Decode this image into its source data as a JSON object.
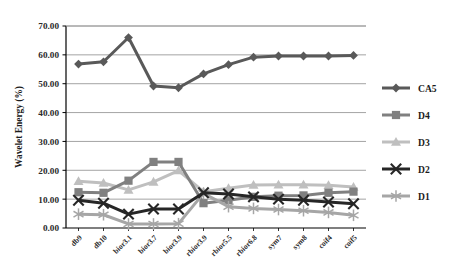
{
  "chart_data": {
    "type": "line",
    "title": "",
    "xlabel": "",
    "ylabel": "Wavelet Energy (%)",
    "ylim": [
      0,
      70
    ],
    "ytick_step": 10,
    "ytick_labels": [
      "0.00",
      "10.00",
      "20.00",
      "30.00",
      "40.00",
      "50.00",
      "60.00",
      "70.00"
    ],
    "ytick_values": [
      0,
      10,
      20,
      30,
      40,
      50,
      60,
      70
    ],
    "grid": "horizontal",
    "legend_position": "right",
    "categories": [
      "db9",
      "db10",
      "bior3.1",
      "bior3.7",
      "bior3.9",
      "rbior3.9",
      "rbior5.5",
      "rbior6.8",
      "sym7",
      "sym8",
      "coif4",
      "coif5"
    ],
    "series": [
      {
        "name": "CA5",
        "marker": "diamond",
        "color": "#595959",
        "values": [
          56.8,
          57.6,
          66.0,
          49.2,
          48.6,
          53.4,
          56.6,
          59.2,
          59.6,
          59.6,
          59.6,
          59.8
        ]
      },
      {
        "name": "D4",
        "marker": "square",
        "color": "#808080",
        "values": [
          12.4,
          12.2,
          16.4,
          22.9,
          22.9,
          8.6,
          9.6,
          10.8,
          11.2,
          11.3,
          12.2,
          12.6
        ]
      },
      {
        "name": "D3",
        "marker": "triangle",
        "color": "#bfbfbf",
        "values": [
          16.2,
          15.6,
          13.2,
          16.0,
          19.9,
          12.6,
          13.8,
          14.9,
          15.0,
          15.0,
          14.8,
          14.2
        ]
      },
      {
        "name": "D2",
        "marker": "x",
        "color": "#262626",
        "values": [
          9.6,
          8.6,
          4.8,
          6.6,
          6.6,
          12.2,
          11.8,
          10.8,
          10.0,
          9.6,
          9.0,
          8.4
        ]
      },
      {
        "name": "D1",
        "marker": "star",
        "color": "#a6a6a6",
        "values": [
          4.8,
          4.6,
          1.4,
          1.4,
          1.5,
          12.0,
          7.4,
          6.8,
          6.4,
          6.0,
          5.4,
          4.4
        ]
      }
    ]
  },
  "legend": {
    "items": [
      {
        "label": "CA5"
      },
      {
        "label": "D4"
      },
      {
        "label": "D3"
      },
      {
        "label": "D2"
      },
      {
        "label": "D1"
      }
    ]
  }
}
